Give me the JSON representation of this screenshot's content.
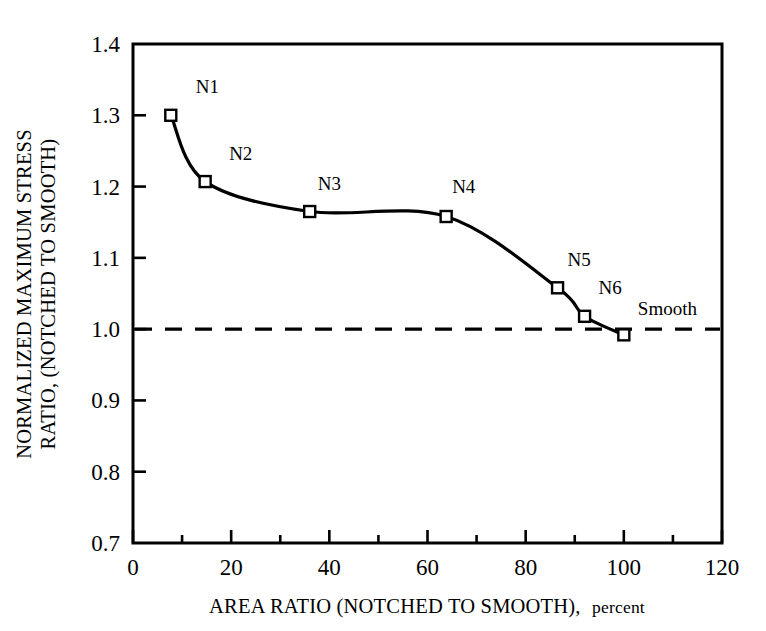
{
  "chart_data": {
    "type": "line",
    "title": "",
    "xlabel_main": "AREA RATIO (NOTCHED TO SMOOTH),",
    "xlabel_suffix": "percent",
    "ylabel_line1": "NORMALIZED MAXIMUM STRESS",
    "ylabel_line2": "RATIO, (NOTCHED TO SMOOTH)",
    "xlim": [
      0,
      120
    ],
    "ylim": [
      0.7,
      1.4
    ],
    "x_major_ticks": [
      0,
      20,
      40,
      60,
      80,
      100,
      120
    ],
    "x_minor_ticks": [
      10,
      30,
      50,
      70,
      90,
      110
    ],
    "x_tick_labels": [
      "0",
      "20",
      "40",
      "60",
      "80",
      "100",
      "120"
    ],
    "y_major_ticks": [
      0.7,
      0.8,
      0.9,
      1.0,
      1.1,
      1.2,
      1.3,
      1.4
    ],
    "y_tick_labels": [
      "0.7",
      "0.8",
      "0.9",
      "1.0",
      "1.1",
      "1.2",
      "1.3",
      "1.4"
    ],
    "grid": false,
    "legend": "none",
    "marker_style": "open-square",
    "line_color": "#000000",
    "reference_line": {
      "label": "",
      "y": 1.0,
      "style": "dashed",
      "color": "#000000"
    },
    "series": [
      {
        "name": "Normalized maximum stress ratio",
        "x": [
          7.7,
          14.7,
          36.0,
          63.8,
          86.5,
          92.0,
          100.0
        ],
        "values": [
          1.3,
          1.207,
          1.165,
          1.158,
          1.058,
          1.018,
          0.992
        ],
        "point_labels": [
          "N1",
          "N2",
          "N3",
          "N4",
          "N5",
          "N6",
          "Smooth"
        ]
      }
    ],
    "annotations": [
      {
        "text": "N1",
        "x": 7.7,
        "y": 1.3,
        "dx": 25,
        "dy": -22
      },
      {
        "text": "N2",
        "x": 14.7,
        "y": 1.207,
        "dx": 24,
        "dy": -22
      },
      {
        "text": "N3",
        "x": 36.0,
        "y": 1.165,
        "dx": 8,
        "dy": -22
      },
      {
        "text": "N4",
        "x": 63.8,
        "y": 1.158,
        "dx": 6,
        "dy": -24
      },
      {
        "text": "N5",
        "x": 86.5,
        "y": 1.058,
        "dx": 10,
        "dy": -22
      },
      {
        "text": "N6",
        "x": 92.0,
        "y": 1.018,
        "dx": 14,
        "dy": -22
      },
      {
        "text": "Smooth",
        "x": 100.0,
        "y": 0.992,
        "dx": 14,
        "dy": -20
      }
    ]
  }
}
